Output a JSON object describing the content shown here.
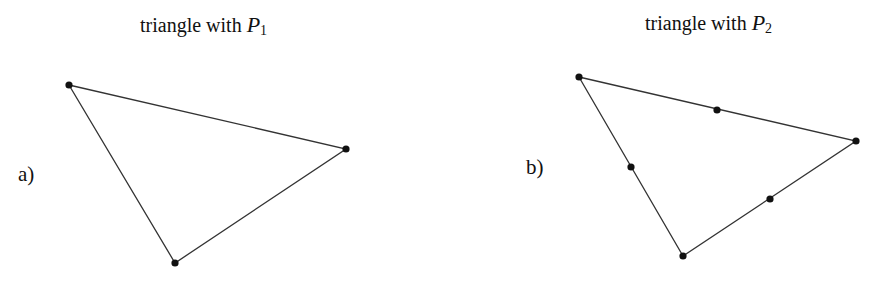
{
  "panels": [
    {
      "id": "a",
      "label": "a)",
      "title_prefix": "triangle with ",
      "title_var": "P",
      "title_sub": "1",
      "vertices": [
        [
          69,
          85
        ],
        [
          346,
          149
        ],
        [
          175,
          263
        ]
      ],
      "edge_nodes": []
    },
    {
      "id": "b",
      "label": "b)",
      "title_prefix": "triangle with ",
      "title_var": "P",
      "title_sub": "2",
      "vertices": [
        [
          579,
          77
        ],
        [
          856,
          141
        ],
        [
          683,
          256
        ]
      ],
      "edge_nodes": [
        [
          717,
          110
        ],
        [
          770,
          199
        ],
        [
          631,
          167
        ]
      ]
    }
  ]
}
